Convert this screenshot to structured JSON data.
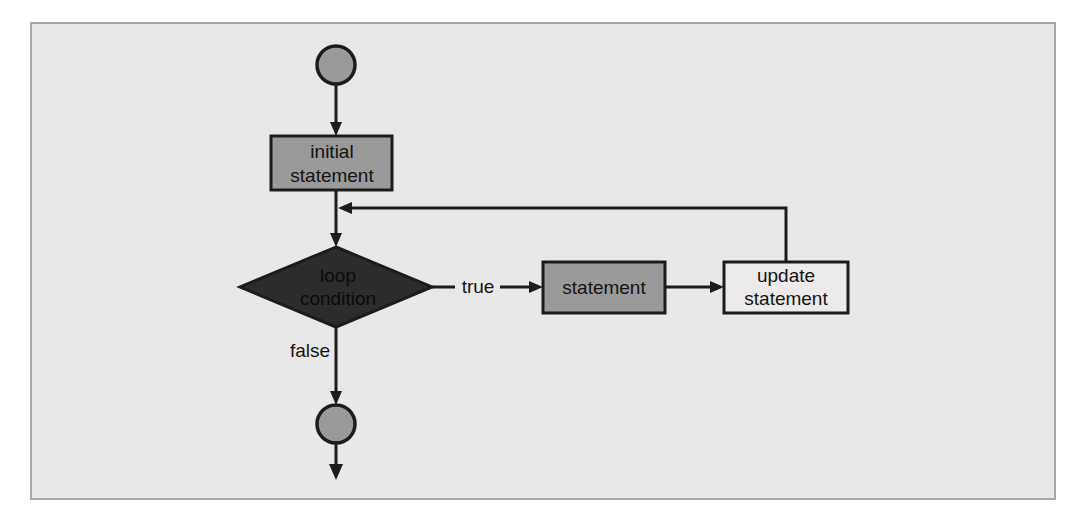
{
  "diagram": {
    "type": "flowchart",
    "background_color": "#e8e8e8",
    "border_color": "#a7a7a7",
    "nodes": [
      {
        "id": "start",
        "kind": "terminator-circle",
        "label": "",
        "fill": "#9a9a9a",
        "stroke": "#1c1c1c"
      },
      {
        "id": "initial_statement",
        "kind": "process-box",
        "label_line1": "initial",
        "label_line2": "statement",
        "fill": "#9a9a9a",
        "stroke": "#1c1c1c"
      },
      {
        "id": "loop_condition",
        "kind": "decision-diamond",
        "label_line1": "loop",
        "label_line2": "condition",
        "fill": "#2c2c2c",
        "stroke": "#1c1c1c"
      },
      {
        "id": "statement",
        "kind": "process-box",
        "label_line1": "statement",
        "label_line2": "",
        "fill": "#9a9a9a",
        "stroke": "#1c1c1c"
      },
      {
        "id": "update_statement",
        "kind": "process-box",
        "label_line1": "update",
        "label_line2": "statement",
        "fill": "#eceaea",
        "stroke": "#1c1c1c"
      },
      {
        "id": "end",
        "kind": "terminator-circle",
        "label": "",
        "fill": "#9a9a9a",
        "stroke": "#1c1c1c"
      }
    ],
    "edges": [
      {
        "id": "start-to-initial",
        "from": "start",
        "to": "initial_statement",
        "label": ""
      },
      {
        "id": "initial-to-condition",
        "from": "initial_statement",
        "to": "loop_condition",
        "label": ""
      },
      {
        "id": "condition-to-statement",
        "from": "loop_condition",
        "to": "statement",
        "label": "true"
      },
      {
        "id": "statement-to-update",
        "from": "statement",
        "to": "update_statement",
        "label": ""
      },
      {
        "id": "update-feedback",
        "from": "update_statement",
        "to": "initial-to-condition",
        "label": ""
      },
      {
        "id": "condition-to-end",
        "from": "loop_condition",
        "to": "end",
        "label": "false"
      },
      {
        "id": "end-exit",
        "from": "end",
        "to": "",
        "label": ""
      }
    ]
  }
}
